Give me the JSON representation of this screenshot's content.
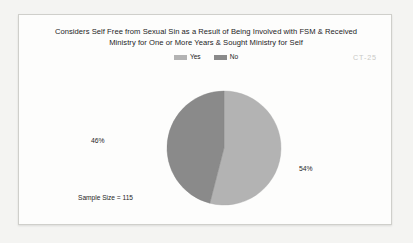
{
  "frame": {
    "watermark": "CT-25"
  },
  "chart_data": {
    "type": "pie",
    "title": "Considers Self Free from Sexual Sin as a Result of Being Involved with FSM & Received Ministry for One or More Years & Sought Ministry for Self",
    "title_lines": [
      "Considers Self Free from Sexual Sin as a Result of Being Involved with FSM & Received",
      "Ministry for One or More Years & Sought Ministry for Self"
    ],
    "categories": [
      "Yes",
      "No"
    ],
    "values": [
      54,
      46
    ],
    "value_labels": [
      "54%",
      "46%"
    ],
    "units": "percent",
    "colors": [
      "#b3b3b3",
      "#8a8a8a"
    ],
    "legend": {
      "position": "top",
      "entries": [
        {
          "label": "Yes",
          "color": "#b3b3b3"
        },
        {
          "label": "No",
          "color": "#8a8a8a"
        }
      ]
    },
    "annotations": [
      {
        "name": "sample-size",
        "text": "Sample Size = 115"
      }
    ],
    "sample_size": 115,
    "sample_size_text": "Sample Size = 115",
    "xlabel": "",
    "ylabel": "",
    "grid": false
  }
}
